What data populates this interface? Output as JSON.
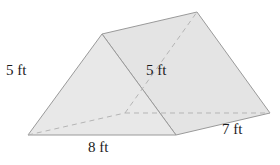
{
  "figure": {
    "shape": "triangular prism",
    "labels": {
      "slant_side": "5 ft",
      "height": "5 ft",
      "base_width": "8 ft",
      "length": "7 ft"
    },
    "colors": {
      "face_fill": "#e6e6e6",
      "edge": "#9a9a9a",
      "hidden_edge": "#b5b5b5",
      "text": "#1a1a1a"
    }
  }
}
